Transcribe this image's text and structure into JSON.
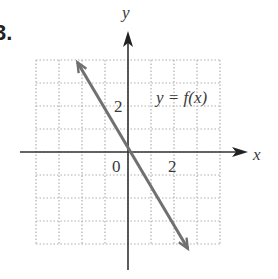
{
  "problem": {
    "number_label": "3."
  },
  "chart_data": {
    "type": "line",
    "title": "",
    "function_label": "y = f(x)",
    "xlabel": "x",
    "ylabel": "y",
    "xlim": [
      -4,
      4
    ],
    "ylim": [
      -4,
      4
    ],
    "grid": true,
    "grid_style": "dotted",
    "grid_step": 1,
    "x_tick_labels": [
      {
        "value": 2,
        "label": "2"
      }
    ],
    "y_tick_labels": [
      {
        "value": 2,
        "label": "2"
      }
    ],
    "origin_label": "0",
    "series": [
      {
        "name": "y = f(x)",
        "equation": "y = -2x",
        "x": [
          -2.2,
          -2,
          -1,
          0,
          1,
          2,
          2.6
        ],
        "y": [
          4.4,
          4,
          2,
          0,
          -2,
          -4,
          -5.2
        ],
        "arrows_both_ends": true,
        "color": "#707070"
      }
    ],
    "axis_color": "#333333",
    "grid_color": "#b0b0b0"
  }
}
